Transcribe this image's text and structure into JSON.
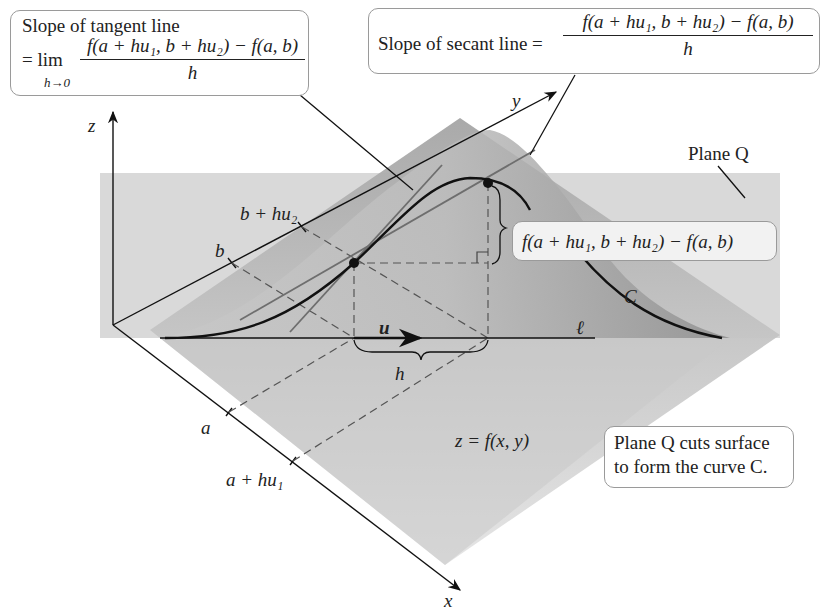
{
  "callouts": {
    "tangent": {
      "line1": "Slope of tangent line",
      "eq": "= lim",
      "limit_sub": "h→0",
      "numerator": "f(a + hu₁, b + hu₂) − f(a, b)",
      "denominator": "h"
    },
    "secant": {
      "label": "Slope of secant line =",
      "numerator": "f(a + hu₁, b + hu₂) − f(a, b)",
      "denominator": "h"
    },
    "difference": "f(a + hu₁, b + hu₂) − f(a, b)",
    "plane_note_line1": "Plane Q cuts surface",
    "plane_note_line2": "to form the curve C."
  },
  "labels": {
    "z_axis": "z",
    "y_axis": "y",
    "x_axis": "x",
    "plane": "Plane Q",
    "curve": "C",
    "line": "ℓ",
    "vector": "u",
    "step": "h",
    "b": "b",
    "b_hu2": "b + hu₂",
    "a": "a",
    "a_hu1": "a + hu₁",
    "surface": "z = f(x, y)"
  },
  "colors": {
    "plane_fill": "#d6d6d6",
    "surface_dark": "#9c9c9c",
    "surface_light": "#e6e6e6",
    "curve": "#111111",
    "box_border": "#9a9a9a"
  }
}
